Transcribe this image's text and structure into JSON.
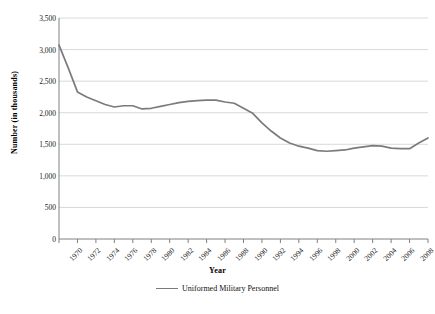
{
  "chart_data": {
    "type": "line",
    "title": "",
    "xlabel": "Year",
    "ylabel": "Number (in thousands)",
    "xlim": [
      1970,
      2010
    ],
    "ylim": [
      0,
      3500
    ],
    "ytick_step": 500,
    "xtick_step": 2,
    "grid": "horizontal",
    "legend_position": "bottom-center",
    "line_color": "#7b7b7b",
    "gridline_color": "#d9d9d9",
    "axis_color": "#808080",
    "ytick_labels": [
      "0",
      "500",
      "1,000",
      "1,500",
      "2,000",
      "2,500",
      "3,000",
      "3,500"
    ],
    "ytick_values": [
      0,
      500,
      1000,
      1500,
      2000,
      2500,
      3000,
      3500
    ],
    "xtick_labels": [
      "1970",
      "1972",
      "1974",
      "1976",
      "1978",
      "1980",
      "1982",
      "1984",
      "1986",
      "1988",
      "1990",
      "1992",
      "1994",
      "1996",
      "1998",
      "2000",
      "2002",
      "2004",
      "2006",
      "2008",
      "2010"
    ],
    "xtick_values": [
      1970,
      1972,
      1974,
      1976,
      1978,
      1980,
      1982,
      1984,
      1986,
      1988,
      1990,
      1992,
      1994,
      1996,
      1998,
      2000,
      2002,
      2004,
      2006,
      2008,
      2010
    ],
    "series": [
      {
        "name": "Uniformed Military Personnel",
        "color": "#7b7b7b",
        "x": [
          1970,
          1971,
          1972,
          1973,
          1974,
          1975,
          1976,
          1977,
          1978,
          1979,
          1980,
          1981,
          1982,
          1983,
          1984,
          1985,
          1986,
          1987,
          1988,
          1989,
          1990,
          1991,
          1992,
          1993,
          1994,
          1995,
          1996,
          1997,
          1998,
          1999,
          2000,
          2001,
          2002,
          2003,
          2004,
          2005,
          2006,
          2007,
          2008,
          2009,
          2010
        ],
        "values": [
          3070,
          2710,
          2330,
          2250,
          2190,
          2130,
          2090,
          2110,
          2110,
          2060,
          2070,
          2100,
          2130,
          2160,
          2180,
          2190,
          2200,
          2200,
          2170,
          2150,
          2070,
          1990,
          1840,
          1710,
          1600,
          1520,
          1470,
          1440,
          1400,
          1390,
          1400,
          1410,
          1440,
          1460,
          1480,
          1470,
          1440,
          1430,
          1430,
          1520,
          1600
        ]
      }
    ]
  }
}
